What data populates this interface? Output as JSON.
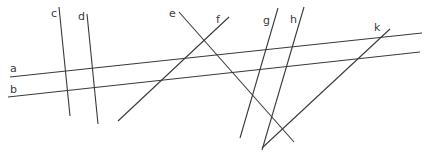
{
  "diagram": {
    "title": "",
    "lines": [
      {
        "id": "a",
        "label": "a"
      },
      {
        "id": "b",
        "label": "b"
      },
      {
        "id": "c",
        "label": "c"
      },
      {
        "id": "d",
        "label": "d"
      },
      {
        "id": "e",
        "label": "e"
      },
      {
        "id": "f",
        "label": "f"
      },
      {
        "id": "g",
        "label": "g"
      },
      {
        "id": "h",
        "label": "h"
      },
      {
        "id": "k",
        "label": "k"
      }
    ],
    "line_color": "#3a3a3a",
    "background": "#ffffff"
  }
}
